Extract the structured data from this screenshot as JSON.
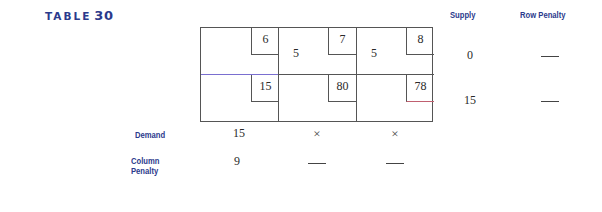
{
  "table": {
    "label": "TABLE",
    "number": "30"
  },
  "headers": {
    "supply": "Supply",
    "row_penalty": "Row Penalty",
    "demand": "Demand",
    "column_penalty_line1": "Column",
    "column_penalty_line2": "Penalty"
  },
  "rows": [
    {
      "cells": [
        {
          "cost": "6",
          "allocation": ""
        },
        {
          "cost": "7",
          "allocation": "5"
        },
        {
          "cost": "8",
          "allocation": "5"
        }
      ],
      "supply": "0",
      "row_penalty": "—"
    },
    {
      "cells": [
        {
          "cost": "15",
          "allocation": ""
        },
        {
          "cost": "80",
          "allocation": ""
        },
        {
          "cost": "78",
          "allocation": ""
        }
      ],
      "supply": "15",
      "row_penalty": "—"
    }
  ],
  "demand": [
    "15",
    "×",
    "×"
  ],
  "column_penalty": [
    "9",
    "—",
    "—"
  ]
}
